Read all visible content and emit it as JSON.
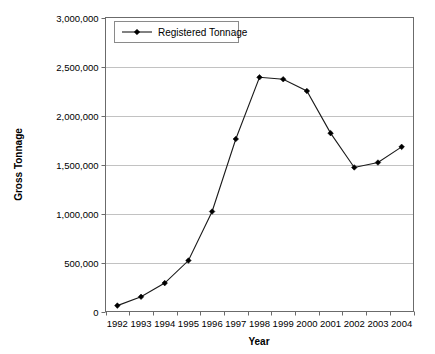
{
  "chart_data": {
    "type": "line",
    "title": "",
    "xlabel": "Year",
    "ylabel": "Gross Tonnage",
    "categories": [
      "1992",
      "1993",
      "1994",
      "1995",
      "1996",
      "1997",
      "1998",
      "1999",
      "2000",
      "2001",
      "2002",
      "2003",
      "2004"
    ],
    "series": [
      {
        "name": "Registered Tonnage",
        "values": [
          60000,
          150000,
          290000,
          520000,
          1020000,
          1760000,
          2390000,
          2370000,
          2250000,
          1820000,
          1470000,
          1520000,
          1680000
        ]
      }
    ],
    "ylim": [
      0,
      3000000
    ],
    "ytick_values": [
      0,
      500000,
      1000000,
      1500000,
      2000000,
      2500000,
      3000000
    ],
    "ytick_labels": [
      "0",
      "500,000",
      "1,000,000",
      "1,500,000",
      "2,000,000",
      "2,500,000",
      "3,000,000"
    ],
    "grid": true,
    "grid_axis": "y",
    "legend": {
      "position": "top-left-inside",
      "entries": [
        "Registered Tonnage"
      ]
    },
    "marker": "diamond",
    "colors": {
      "line": "#1a1a1a",
      "marker": "#000000",
      "grid": "#b3b3b3",
      "axis": "#6b6b6b",
      "background": "#ffffff"
    }
  }
}
